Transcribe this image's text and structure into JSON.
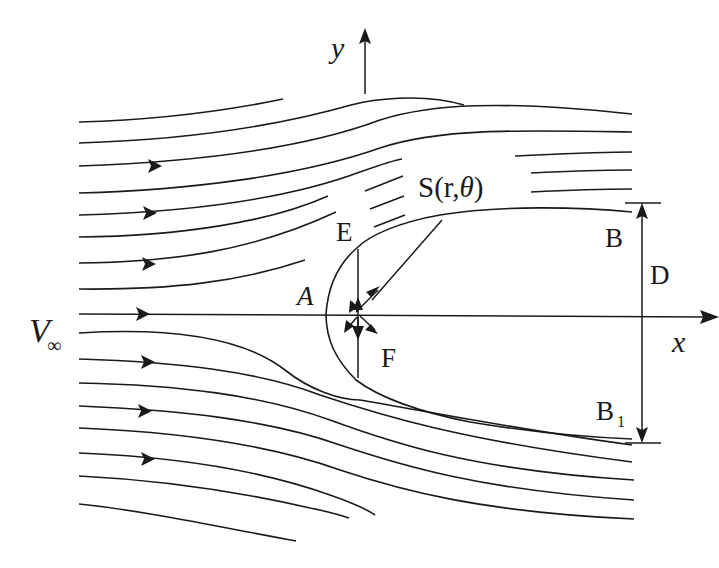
{
  "figure": {
    "axes": {
      "x_label": "x",
      "y_label": "y"
    },
    "labels": {
      "free_stream": "V",
      "free_stream_subscript": "∞",
      "point_A": "A",
      "point_E": "E",
      "point_F": "F",
      "point_S": "S(r,",
      "point_S_theta": "θ",
      "point_S_close": ")",
      "point_B": "B",
      "point_B1": "B",
      "point_B1_subscript": "1",
      "dimension_D": "D"
    },
    "colors": {
      "line": "#1a1a1a",
      "background": "#ffffff"
    },
    "streamline_count_upper": 11,
    "streamline_count_lower": 10,
    "flow_direction": "left-to-right"
  }
}
